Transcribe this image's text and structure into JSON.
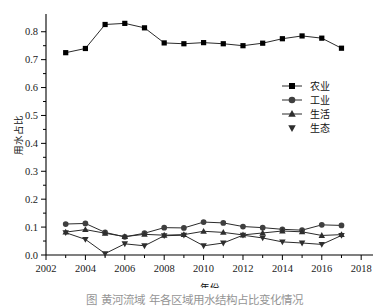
{
  "figure": {
    "caption": "图    黄河流域              年各区域用水结构占比变化情况",
    "background": "#ffffff"
  },
  "chart_data": {
    "type": "line",
    "title": "",
    "xlabel": "年份",
    "ylabel": "用水占比",
    "xlim": [
      2002,
      2018.6
    ],
    "ylim": [
      0.0,
      0.86
    ],
    "grid": false,
    "legend_position": "center-right",
    "xticks": [
      2002,
      2004,
      2006,
      2008,
      2010,
      2012,
      2014,
      2016,
      2018
    ],
    "xtick_labels": [
      "2002",
      "2004",
      "2006",
      "2008",
      "2010",
      "2012",
      "2014",
      "2016",
      "2018"
    ],
    "x_minor_ticks": [
      2003,
      2005,
      2007,
      2009,
      2011,
      2013,
      2015,
      2017
    ],
    "yticks": [
      0.0,
      0.1,
      0.2,
      0.3,
      0.4,
      0.5,
      0.6,
      0.7,
      0.8
    ],
    "ytick_labels": [
      "0.0",
      "0.1",
      "0.2",
      "0.3",
      "0.4",
      "0.5",
      "0.6",
      "0.7",
      "0.8"
    ],
    "y_minor_ticks": [
      0.05,
      0.15,
      0.25,
      0.35,
      0.45,
      0.55,
      0.65,
      0.75
    ],
    "x": [
      2003,
      2004,
      2005,
      2006,
      2007,
      2008,
      2009,
      2010,
      2011,
      2012,
      2013,
      2014,
      2015,
      2016,
      2017
    ],
    "series": [
      {
        "name": "农业",
        "marker": "square",
        "color": "#000000",
        "has_line": true,
        "values": [
          0.725,
          0.74,
          0.826,
          0.83,
          0.814,
          0.76,
          0.757,
          0.761,
          0.757,
          0.75,
          0.759,
          0.775,
          0.785,
          0.777,
          0.741
        ]
      },
      {
        "name": "工业",
        "marker": "circle",
        "color": "#3f3f3f",
        "has_line": true,
        "values": [
          0.111,
          0.113,
          0.081,
          0.065,
          0.078,
          0.098,
          0.097,
          0.118,
          0.115,
          0.102,
          0.098,
          0.092,
          0.089,
          0.108,
          0.106
        ]
      },
      {
        "name": "生活",
        "marker": "triangle-up",
        "color": "#2e2e2e",
        "has_line": true,
        "values": [
          0.082,
          0.091,
          0.078,
          0.066,
          0.074,
          0.071,
          0.073,
          0.085,
          0.081,
          0.072,
          0.079,
          0.086,
          0.083,
          0.07,
          0.073
        ]
      },
      {
        "name": "生态",
        "marker": "triangle-down",
        "color": "#2e2e2e",
        "has_line": true,
        "values": [
          0.08,
          0.056,
          0.005,
          0.04,
          0.033,
          0.069,
          0.071,
          0.033,
          0.043,
          0.071,
          0.061,
          0.047,
          0.043,
          0.038,
          0.07
        ]
      }
    ]
  }
}
